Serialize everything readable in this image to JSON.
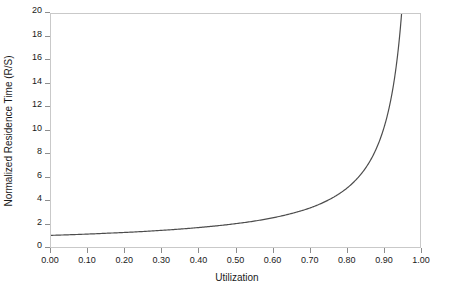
{
  "chart_data": {
    "type": "line",
    "title": "",
    "subtitle": "",
    "xlabel": "Utilization",
    "ylabel": "Normalized Residence Time (R/S)",
    "xlim": [
      0.0,
      1.0
    ],
    "ylim": [
      0,
      20
    ],
    "grid": false,
    "legend": null,
    "legend_position": "none",
    "annotations": [],
    "xticks": [
      "0.00",
      "0.10",
      "0.20",
      "0.30",
      "0.40",
      "0.50",
      "0.60",
      "0.70",
      "0.80",
      "0.90",
      "1.00"
    ],
    "xtick_values": [
      0.0,
      0.1,
      0.2,
      0.3,
      0.4,
      0.5,
      0.6,
      0.7,
      0.8,
      0.9,
      1.0
    ],
    "yticks": [
      "0",
      "2",
      "4",
      "6",
      "8",
      "10",
      "12",
      "14",
      "16",
      "18",
      "20"
    ],
    "ytick_values": [
      0,
      2,
      4,
      6,
      8,
      10,
      12,
      14,
      16,
      18,
      20
    ],
    "series": [
      {
        "name": "R/S = 1/(1-U)",
        "x": [
          0.0,
          0.05,
          0.1,
          0.15,
          0.2,
          0.25,
          0.3,
          0.35,
          0.4,
          0.45,
          0.5,
          0.55,
          0.6,
          0.65,
          0.7,
          0.72,
          0.74,
          0.76,
          0.78,
          0.8,
          0.82,
          0.84,
          0.86,
          0.88,
          0.9,
          0.91,
          0.92,
          0.93,
          0.94,
          0.95
        ],
        "y": [
          1.0,
          1.05,
          1.11,
          1.18,
          1.25,
          1.33,
          1.43,
          1.54,
          1.67,
          1.82,
          2.0,
          2.22,
          2.5,
          2.86,
          3.33,
          3.57,
          3.85,
          4.17,
          4.55,
          5.0,
          5.56,
          6.25,
          7.14,
          8.33,
          10.0,
          11.11,
          12.5,
          14.29,
          16.67,
          20.0
        ]
      }
    ],
    "curve_color": "#4d4d4d",
    "frame_color": "#c9c9c9",
    "background_color": "#ffffff"
  }
}
